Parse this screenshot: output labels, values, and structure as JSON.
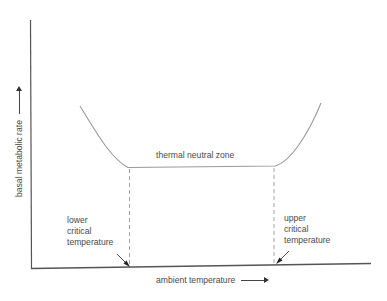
{
  "diagram": {
    "title": "",
    "y_axis": {
      "label": "basal metabolic rate",
      "arrow": "up-arrow"
    },
    "x_axis": {
      "label": "ambient temperature",
      "arrow": "right-arrow"
    },
    "curve": {
      "description": "U-shaped metabolic rate curve with flat bottom",
      "color": "#999999"
    },
    "zone_label": "thermal neutral zone",
    "lower_critical": {
      "lines": [
        "lower",
        "critical",
        "temperature"
      ]
    },
    "upper_critical": {
      "lines": [
        "upper",
        "critical",
        "temperature"
      ]
    },
    "colors": {
      "axis": "#555555",
      "curve": "#9a9a9a",
      "dashed": "#999999",
      "text": "#4a4a4a"
    }
  }
}
